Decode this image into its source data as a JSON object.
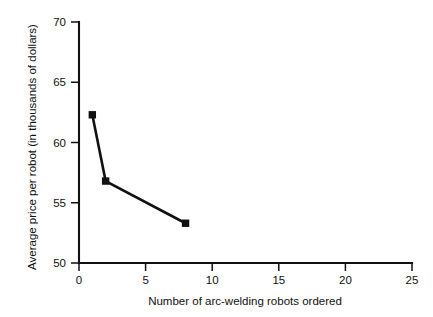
{
  "chart_data": {
    "type": "line",
    "title": "",
    "xlabel": "Number of arc-welding robots ordered",
    "ylabel": "Average price per robot (in thousands of dollars)",
    "xlim": [
      0,
      25
    ],
    "ylim": [
      50,
      70
    ],
    "xticks": [
      0,
      5,
      10,
      15,
      20,
      25
    ],
    "yticks": [
      50,
      55,
      60,
      65,
      70
    ],
    "xtick_labels": [
      "0",
      "5",
      "10",
      "15",
      "20",
      "25"
    ],
    "ytick_labels": [
      "50",
      "55",
      "60",
      "65",
      "70"
    ],
    "grid": false,
    "legend": false,
    "marker": "square",
    "line_color": "#111111",
    "marker_color": "#111111",
    "x": [
      1,
      2,
      8
    ],
    "values": [
      62.3,
      56.8,
      53.3
    ],
    "points": [
      {
        "x": 1,
        "y": 62.3
      },
      {
        "x": 2,
        "y": 56.8
      },
      {
        "x": 8,
        "y": 53.3
      }
    ]
  }
}
